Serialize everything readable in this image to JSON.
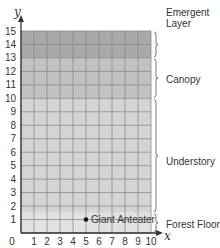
{
  "chart_data": {
    "type": "scatter",
    "title": "",
    "xlabel": "x",
    "ylabel": "y",
    "xlim": [
      0,
      10
    ],
    "ylim": [
      0,
      15
    ],
    "x_ticks": [
      "0",
      "1",
      "2",
      "3",
      "4",
      "5",
      "6",
      "7",
      "8",
      "9",
      "10"
    ],
    "y_ticks": [
      "1",
      "2",
      "3",
      "4",
      "5",
      "6",
      "7",
      "8",
      "9",
      "10",
      "11",
      "12",
      "13",
      "14",
      "15"
    ],
    "grid": true,
    "points": [
      {
        "label": "Giant Anteater",
        "x": 5,
        "y": 1
      }
    ],
    "bands": [
      {
        "name": "Forest Floor",
        "y_from": 0,
        "y_to": 1.5,
        "color": "#e2e2e2"
      },
      {
        "name": "Understory",
        "y_from": 1.5,
        "y_to": 10,
        "color": "#d4d4d4"
      },
      {
        "name": "Canopy",
        "y_from": 10,
        "y_to": 13,
        "color": "#c2c2c2"
      },
      {
        "name": "Emergent Layer",
        "y_from": 13,
        "y_to": 15,
        "color": "#a9a9a9"
      }
    ]
  },
  "labels": {
    "emergent_line1": "Emergent",
    "emergent_line2": "Layer",
    "canopy": "Canopy",
    "understory": "Understory",
    "forest_floor": "Forest Floor",
    "point": "Giant Anteater",
    "x_axis": "x",
    "y_axis": "y"
  }
}
